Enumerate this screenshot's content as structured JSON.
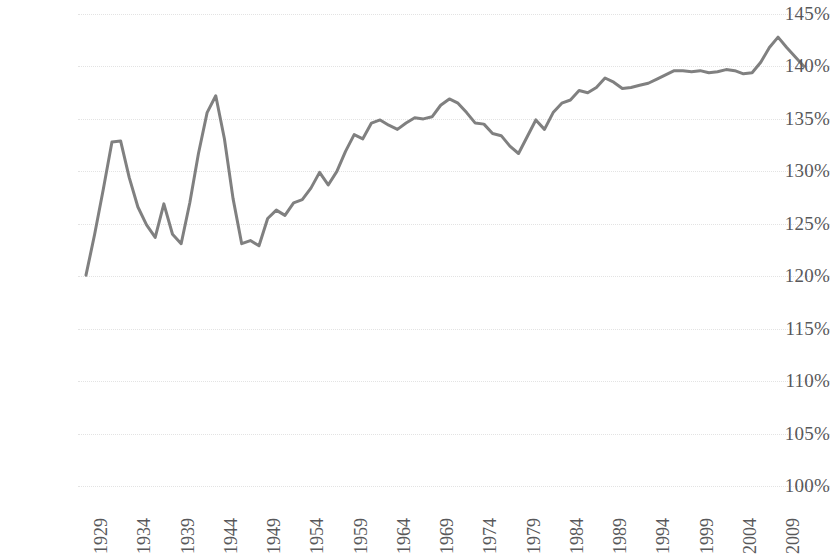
{
  "chart_data": {
    "type": "line",
    "title": "",
    "subtitle": "",
    "xlabel": "",
    "ylabel": "",
    "xlim": [
      1929,
      2012
    ],
    "ylim": [
      100,
      145
    ],
    "grid": true,
    "legend": false,
    "legend_position": "none",
    "line_color": "#808080",
    "line_width": 3,
    "y_tick_labels": [
      "145%",
      "140%",
      "135%",
      "130%",
      "125%",
      "120%",
      "115%",
      "110%",
      "105%",
      "100%"
    ],
    "y_tick_values": [
      145,
      140,
      135,
      130,
      125,
      120,
      115,
      110,
      105,
      100
    ],
    "x_tick_labels": [
      "1929",
      "1934",
      "1939",
      "1944",
      "1949",
      "1954",
      "1959",
      "1964",
      "1969",
      "1974",
      "1979",
      "1984",
      "1989",
      "1994",
      "1999",
      "2004",
      "2009"
    ],
    "x_tick_values": [
      1929,
      1934,
      1939,
      1944,
      1949,
      1954,
      1959,
      1964,
      1969,
      1974,
      1979,
      1984,
      1989,
      1994,
      1999,
      2004,
      2009
    ],
    "x": [
      1929,
      1930,
      1931,
      1932,
      1933,
      1934,
      1935,
      1936,
      1937,
      1938,
      1939,
      1940,
      1941,
      1942,
      1943,
      1944,
      1945,
      1946,
      1947,
      1948,
      1949,
      1950,
      1951,
      1952,
      1953,
      1954,
      1955,
      1956,
      1957,
      1958,
      1959,
      1960,
      1961,
      1962,
      1963,
      1964,
      1965,
      1966,
      1967,
      1968,
      1969,
      1970,
      1971,
      1972,
      1973,
      1974,
      1975,
      1976,
      1977,
      1978,
      1979,
      1980,
      1981,
      1982,
      1983,
      1984,
      1985,
      1986,
      1987,
      1988,
      1989,
      1990,
      1991,
      1992,
      1993,
      1994,
      1995,
      1996,
      1997,
      1998,
      1999,
      2000,
      2001,
      2002,
      2003,
      2004,
      2005,
      2006,
      2007,
      2008,
      2009,
      2010,
      2011,
      2012
    ],
    "y": [
      120.1,
      124.0,
      128.3,
      132.8,
      132.9,
      129.4,
      126.6,
      124.9,
      123.7,
      126.9,
      124.0,
      123.1,
      127.0,
      131.7,
      135.6,
      137.2,
      133.1,
      127.4,
      123.1,
      123.4,
      122.9,
      125.5,
      126.3,
      125.8,
      127.0,
      127.3,
      128.4,
      129.9,
      128.7,
      130.0,
      131.9,
      133.5,
      133.1,
      134.6,
      134.9,
      134.4,
      134.0,
      134.6,
      135.1,
      135.0,
      135.2,
      136.3,
      136.9,
      136.5,
      135.6,
      134.6,
      134.5,
      133.6,
      133.4,
      132.4,
      131.7,
      133.3,
      134.9,
      134.0,
      135.6,
      136.5,
      136.8,
      137.7,
      137.5,
      138.0,
      138.9,
      138.5,
      137.9,
      138.0,
      138.2,
      138.4,
      138.8,
      139.2,
      139.6,
      139.6,
      139.5,
      139.6,
      139.4,
      139.5,
      139.7,
      139.6,
      139.3,
      139.4,
      140.4,
      141.8,
      142.8,
      141.8,
      140.9,
      140.0
    ],
    "data_units": "percent",
    "notable_points": {
      "start": {
        "x": 1929,
        "y": 120.1
      },
      "peak_1933": {
        "x": 1933,
        "y": 132.9
      },
      "peak_1944": {
        "x": 1944,
        "y": 137.2
      },
      "trough_1949": {
        "x": 1949,
        "y": 122.9
      },
      "trough_1979": {
        "x": 1979,
        "y": 131.7
      },
      "peak_2009": {
        "x": 2009,
        "y": 142.8
      },
      "end": {
        "x": 2012,
        "y": 140.0
      }
    }
  },
  "axes": {
    "grid_color": "#e3e3e3",
    "tick_text_color": "#58585a"
  }
}
